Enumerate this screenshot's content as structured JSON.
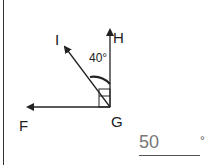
{
  "diagram": {
    "labels": {
      "I": "I",
      "H": "H",
      "F": "F",
      "G": "G"
    },
    "given_angle": "40°",
    "right_angle_marker": true,
    "colors": {
      "line": "#222222",
      "answer_text": "#777777"
    }
  },
  "answer": {
    "value": "50",
    "unit": "°"
  }
}
